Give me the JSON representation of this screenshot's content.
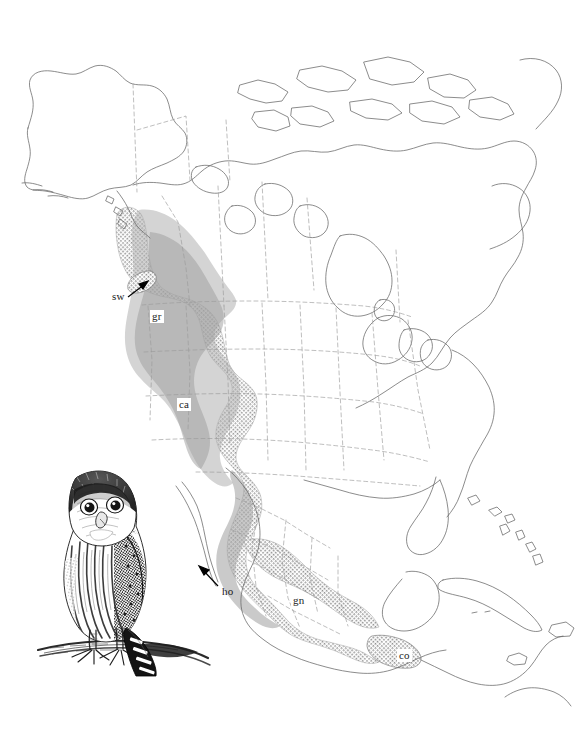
{
  "figure": {
    "kind": "range-map",
    "background_color": "#ffffff",
    "outline_color": "#5a5a5a",
    "border_color": "#8a8a8a",
    "range_fill_color": "#a9a9a9",
    "label_text_color": "#1a1a1a",
    "label_box_color": "#ffffff",
    "arrow_color": "#000000"
  },
  "labels": [
    {
      "id": "sw",
      "text": "sw",
      "x": 112,
      "y": 297,
      "boxed": false,
      "has_leader": true
    },
    {
      "id": "gr",
      "text": "gr",
      "x": 150,
      "y": 316,
      "boxed": true,
      "has_leader": false
    },
    {
      "id": "ca",
      "text": "ca",
      "x": 177,
      "y": 404,
      "boxed": true,
      "has_leader": false
    },
    {
      "id": "ho",
      "text": "ho",
      "x": 222,
      "y": 592,
      "boxed": false,
      "has_leader": true
    },
    {
      "id": "gn",
      "text": "gn",
      "x": 291,
      "y": 600,
      "boxed": true,
      "has_leader": false
    },
    {
      "id": "co",
      "text": "co",
      "x": 397,
      "y": 655,
      "boxed": true,
      "has_leader": false
    }
  ],
  "leaders": [
    {
      "id": "sw-leader",
      "from_x": 128,
      "from_y": 297,
      "to_x": 146,
      "to_y": 283
    },
    {
      "id": "ho-leader",
      "from_x": 218,
      "from_y": 586,
      "to_x": 200,
      "to_y": 567
    }
  ],
  "illustration": {
    "name": "northern-pygmy-owl-perched",
    "description": "pen-and-ink drawing of a perched owl on a branch, tail barred with white bands",
    "x": 30,
    "y": 462,
    "width": 185,
    "height": 215
  }
}
